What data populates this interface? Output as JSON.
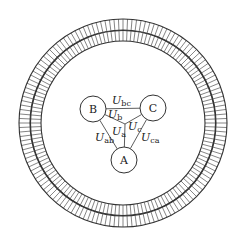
{
  "diagram": {
    "colors": {
      "stroke": "#333333",
      "background": "#ffffff",
      "text": "#222222"
    },
    "rings": {
      "center": [
        123,
        123
      ],
      "outer_band": {
        "r_in": 93,
        "r_out": 104
      },
      "inner_band": {
        "r_in": 82,
        "r_out": 92.5
      },
      "tick_count": 144
    },
    "nodes": [
      {
        "id": "A",
        "label": "A",
        "cx": 124,
        "cy": 160,
        "r": 13
      },
      {
        "id": "B",
        "label": "B",
        "cx": 93,
        "cy": 109,
        "r": 13
      },
      {
        "id": "C",
        "label": "C",
        "cx": 153,
        "cy": 108,
        "r": 13
      }
    ],
    "junction": {
      "x": 125,
      "y": 124
    },
    "edges": [
      {
        "from": "B",
        "to": "C",
        "label_main": "U",
        "label_sub": "bc",
        "lx": 112,
        "ly": 104
      },
      {
        "from": "B",
        "to": "A",
        "label_main": "U",
        "label_sub": "ab",
        "lx": 95,
        "ly": 141
      },
      {
        "from": "C",
        "to": "A",
        "label_main": "U",
        "label_sub": "ca",
        "lx": 141,
        "ly": 141
      },
      {
        "from": "junction",
        "to": "B",
        "label_main": "U",
        "label_sub": "b",
        "lx": 108,
        "ly": 118
      },
      {
        "from": "junction",
        "to": "A",
        "label_main": "U",
        "label_sub": "a",
        "lx": 112,
        "ly": 135
      },
      {
        "from": "junction",
        "to": "C",
        "label_main": "U",
        "label_sub": "c",
        "lx": 128,
        "ly": 130
      }
    ]
  }
}
